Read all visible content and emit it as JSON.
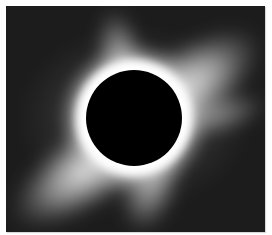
{
  "image": {
    "subject": "Total solar eclipse with white corona streamers",
    "alt": "Black lunar disk surrounded by bright white solar corona against a dark sky",
    "colors": {
      "sky": "#1a1a1a",
      "corona": "#ffffff",
      "moon": "#000000",
      "frame": "#ffffff"
    }
  }
}
